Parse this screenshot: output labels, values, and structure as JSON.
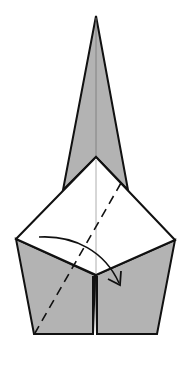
{
  "diagram": {
    "type": "origami-fold-step",
    "colors": {
      "paper_back": "#b3b3b3",
      "paper_front": "#ffffff",
      "outline": "#111111",
      "crease": "#9a9a9a",
      "background": "#ffffff"
    },
    "symbols": {
      "valley_fold_line": "dashed-line",
      "fold_direction": "curved-arrow"
    }
  }
}
